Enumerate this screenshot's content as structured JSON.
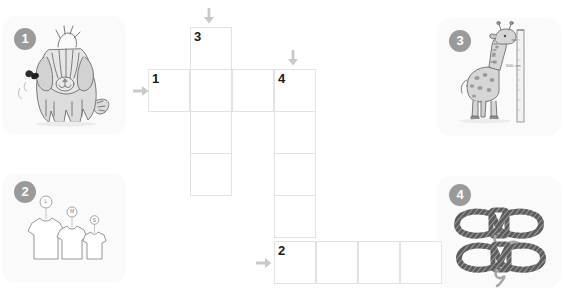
{
  "page": {
    "width": 563,
    "height": 296,
    "background_color": "#ffffff"
  },
  "colors": {
    "badge_background": "#9a9a9a",
    "badge_text": "#ffffff",
    "grid_line": "#e2e2e4",
    "grid_cell_background": "#ffffff",
    "panel_background": "#fafafa",
    "arrow": "#c9c9cb",
    "clue_number_text": "#1a1a1a",
    "artwork_outline": "#6d6d6d",
    "artwork_fill": "#d8d8d8"
  },
  "clue_panels": [
    {
      "number": "1",
      "badge_label": "1",
      "subject": "shaggy dog with fly",
      "icon": "dog-icon",
      "direction": "across",
      "position": {
        "x": 2,
        "y": 16,
        "width": 124,
        "height": 118
      }
    },
    {
      "number": "2",
      "badge_label": "2",
      "subject": "three t-shirts in different sizes",
      "icon": "tshirts-icon",
      "direction": "across",
      "labels": [
        "L",
        "M",
        "S"
      ],
      "position": {
        "x": 2,
        "y": 173,
        "width": 124,
        "height": 110
      }
    },
    {
      "number": "3",
      "badge_label": "3",
      "subject": "giraffe beside height measuring ruler",
      "icon": "giraffe-icon",
      "direction": "down",
      "measurement_label": "500 cm",
      "position": {
        "x": 437,
        "y": 18,
        "width": 124,
        "height": 118
      }
    },
    {
      "number": "4",
      "badge_label": "4",
      "subject": "two coiled ropes of different lengths",
      "icon": "ropes-icon",
      "direction": "down",
      "position": {
        "x": 437,
        "y": 176,
        "width": 124,
        "height": 112
      }
    }
  ],
  "grid": {
    "cell_size": 42,
    "cells": [
      {
        "id": "c3-r0",
        "x": 190,
        "y": 27,
        "number": "3"
      },
      {
        "id": "c1-r1a",
        "x": 148,
        "y": 69,
        "number": "1"
      },
      {
        "id": "c1-r1b",
        "x": 190,
        "y": 69,
        "number": ""
      },
      {
        "id": "c1-r1c",
        "x": 232,
        "y": 69,
        "number": ""
      },
      {
        "id": "c4-r1",
        "x": 274,
        "y": 69,
        "number": "4"
      },
      {
        "id": "c3-r2",
        "x": 190,
        "y": 111,
        "number": ""
      },
      {
        "id": "c4-r2",
        "x": 274,
        "y": 111,
        "number": ""
      },
      {
        "id": "c3-r3",
        "x": 190,
        "y": 153,
        "number": ""
      },
      {
        "id": "c4-r3",
        "x": 274,
        "y": 153,
        "number": ""
      },
      {
        "id": "c4-r4",
        "x": 274,
        "y": 195,
        "number": ""
      },
      {
        "id": "c2-r5a",
        "x": 274,
        "y": 241,
        "number": "2"
      },
      {
        "id": "c2-r5b",
        "x": 316,
        "y": 241,
        "number": ""
      },
      {
        "id": "c2-r5c",
        "x": 358,
        "y": 241,
        "number": ""
      },
      {
        "id": "c2-r5d",
        "x": 400,
        "y": 241,
        "number": ""
      }
    ]
  },
  "arrows": [
    {
      "id": "arrow-down-3",
      "direction": "down",
      "x": 202,
      "y": 8,
      "for_clue": "3"
    },
    {
      "id": "arrow-down-4",
      "direction": "down",
      "x": 286,
      "y": 50,
      "for_clue": "4"
    },
    {
      "id": "arrow-right-1",
      "direction": "right",
      "x": 133,
      "y": 84,
      "for_clue": "1"
    },
    {
      "id": "arrow-right-2",
      "direction": "right",
      "x": 256,
      "y": 256,
      "for_clue": "2"
    }
  ]
}
